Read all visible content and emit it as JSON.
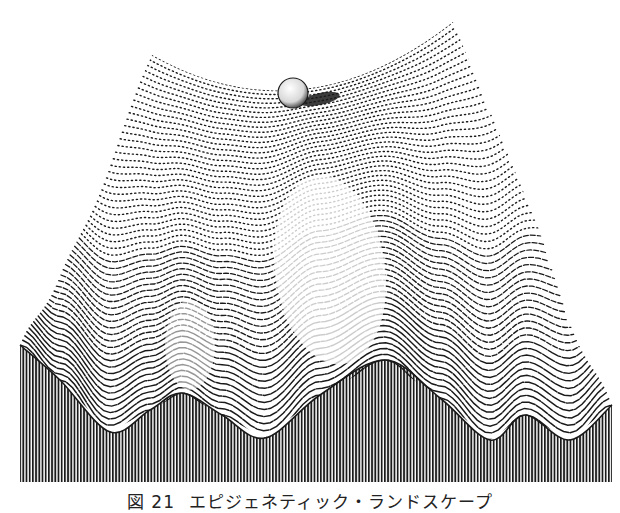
{
  "figure": {
    "caption_label": "図 21",
    "caption_text": "エピジェネティック・ランドスケープ",
    "colors": {
      "ink": "#1a1a1a",
      "paper": "#ffffff"
    },
    "surface": {
      "back_left_corner": [
        152,
        55
      ],
      "back_dip": [
        285,
        105
      ],
      "back_right_corner": [
        453,
        22
      ],
      "front_left_corner": [
        20,
        345
      ],
      "front_right_corner": [
        612,
        405
      ],
      "front_edge_profile": [
        [
          20,
          345
        ],
        [
          60,
          380
        ],
        [
          110,
          432
        ],
        [
          150,
          410
        ],
        [
          182,
          393
        ],
        [
          222,
          415
        ],
        [
          265,
          438
        ],
        [
          320,
          395
        ],
        [
          385,
          360
        ],
        [
          440,
          398
        ],
        [
          490,
          440
        ],
        [
          525,
          415
        ],
        [
          570,
          440
        ],
        [
          612,
          405
        ]
      ],
      "skirt_bottom_y": 482
    },
    "ball": {
      "cx": 293,
      "cy": 93,
      "r": 15
    },
    "icons": [
      "ball-icon",
      "landscape-surface",
      "valley-contours"
    ]
  }
}
